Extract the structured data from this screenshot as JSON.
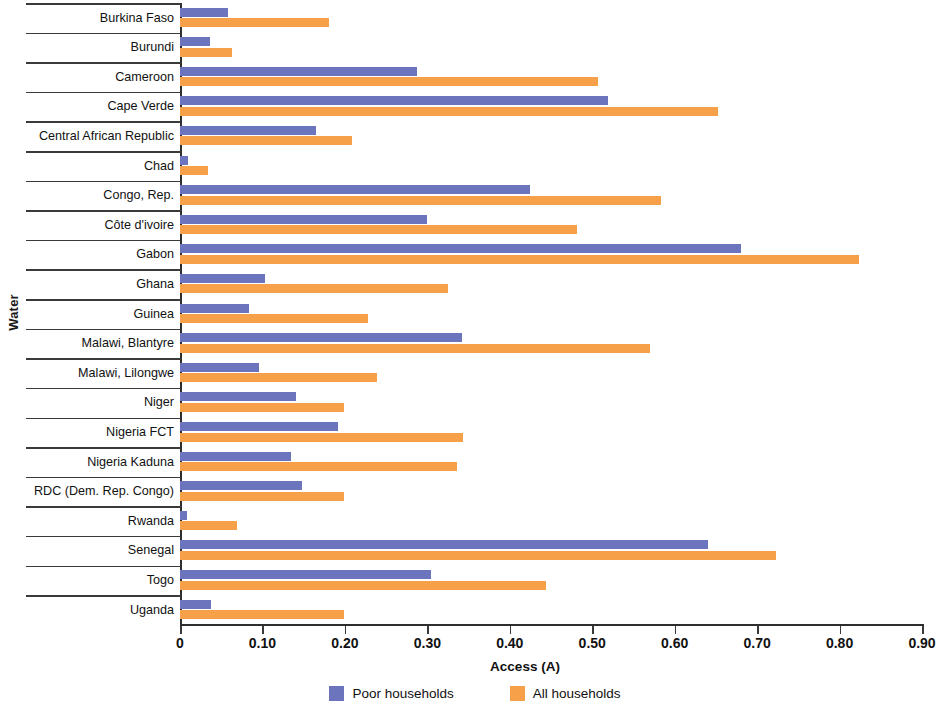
{
  "chart_data": {
    "type": "bar",
    "orientation": "horizontal",
    "title": "",
    "xlabel": "Access (A)",
    "ylabel": "Water",
    "xlim": [
      0,
      0.9
    ],
    "xticks": [
      0,
      0.1,
      0.2,
      0.3,
      0.4,
      0.5,
      0.6,
      0.7,
      0.8,
      0.9
    ],
    "xtick_labels": [
      "0",
      "0.10",
      "0.20",
      "0.30",
      "0.40",
      "0.50",
      "0.60",
      "0.70",
      "0.80",
      "0.90"
    ],
    "grid": false,
    "legend_position": "bottom",
    "categories": [
      "Burkina Faso",
      "Burundi",
      "Cameroon",
      "Cape Verde",
      "Central African Republic",
      "Chad",
      "Congo, Rep.",
      "Côte d'ivoire",
      "Gabon",
      "Ghana",
      "Guinea",
      "Malawi, Blantyre",
      "Malawi, Lilongwe",
      "Niger",
      "Nigeria  FCT",
      "Nigeria Kaduna",
      "RDC (Dem. Rep. Congo)",
      "Rwanda",
      "Senegal",
      "Togo",
      "Uganda"
    ],
    "series": [
      {
        "name": "Poor households",
        "color": "#6b74bd",
        "values": [
          0.058,
          0.036,
          0.288,
          0.519,
          0.165,
          0.01,
          0.425,
          0.299,
          0.68,
          0.103,
          0.084,
          0.342,
          0.096,
          0.141,
          0.192,
          0.135,
          0.148,
          0.008,
          0.641,
          0.304,
          0.038
        ]
      },
      {
        "name": "All households",
        "color": "#f6a04a",
        "values": [
          0.181,
          0.063,
          0.507,
          0.652,
          0.209,
          0.034,
          0.583,
          0.482,
          0.823,
          0.325,
          0.228,
          0.57,
          0.239,
          0.199,
          0.343,
          0.336,
          0.199,
          0.069,
          0.723,
          0.444,
          0.199
        ]
      }
    ]
  },
  "legend": [
    {
      "label": "Poor households",
      "color": "#6b74bd"
    },
    {
      "label": "All households",
      "color": "#f6a04a"
    }
  ]
}
